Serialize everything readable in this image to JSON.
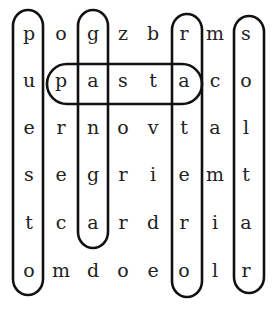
{
  "puzzle": {
    "type": "word-search",
    "rows": 6,
    "cols": 8,
    "grid": [
      [
        "p",
        "o",
        "g",
        "z",
        "b",
        "r",
        "m",
        "s"
      ],
      [
        "u",
        "p",
        "a",
        "s",
        "t",
        "a",
        "c",
        "o"
      ],
      [
        "e",
        "r",
        "n",
        "o",
        "v",
        "t",
        "a",
        "l"
      ],
      [
        "s",
        "e",
        "g",
        "r",
        "i",
        "e",
        "m",
        "t"
      ],
      [
        "t",
        "c",
        "a",
        "r",
        "d",
        "r",
        "i",
        "a"
      ],
      [
        "o",
        "m",
        "d",
        "o",
        "e",
        "o",
        "l",
        "r"
      ]
    ],
    "found_words": [
      {
        "word": "puesto",
        "direction": "vertical",
        "col": 0,
        "row_start": 0,
        "row_end": 5
      },
      {
        "word": "ganga",
        "direction": "vertical",
        "col": 2,
        "row_start": 0,
        "row_end": 4
      },
      {
        "word": "ratero",
        "direction": "vertical",
        "col": 5,
        "row_start": 0,
        "row_end": 5
      },
      {
        "word": "soltar",
        "direction": "vertical",
        "col": 7,
        "row_start": 0,
        "row_end": 5
      },
      {
        "word": "pasta",
        "direction": "horizontal",
        "row": 1,
        "col_start": 1,
        "col_end": 5
      }
    ]
  }
}
